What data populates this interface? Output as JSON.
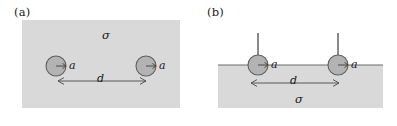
{
  "figure": {
    "width": 397,
    "height": 126,
    "background": "#ffffff",
    "ink_color": "#1a1a1a",
    "medium_fill": "#d9d9d9",
    "sphere_fill": "#b3b3b3",
    "sphere_stroke": "#6e6e6e",
    "line_color": "#555555"
  },
  "panels": [
    {
      "id": "a",
      "label": "(a)",
      "description": "Two spheres of radius a embedded fully inside a conducting medium of conductivity sigma, separated by center-to-center distance d",
      "medium": {
        "shape": "rectangle",
        "x": 22,
        "y": 20,
        "width": 158,
        "height": 88,
        "fill": "#d9d9d9"
      },
      "sigma": {
        "symbol": "σ",
        "x": 102,
        "y": 30
      },
      "spheres": [
        {
          "name": "left-sphere",
          "cx": 56,
          "cy": 66,
          "r": 10,
          "radius_label": "a",
          "radius_label_x": 69,
          "radius_label_y": 61,
          "radius_arrow": {
            "x1": 56,
            "y1": 66,
            "x2": 66,
            "y2": 66
          }
        },
        {
          "name": "right-sphere",
          "cx": 146,
          "cy": 66,
          "r": 10,
          "radius_label": "a",
          "radius_label_x": 159,
          "radius_label_y": 61,
          "radius_arrow": {
            "x1": 146,
            "y1": 66,
            "x2": 156,
            "y2": 66
          }
        }
      ],
      "distance": {
        "label": "d",
        "label_x": 97,
        "label_y": 75,
        "arrow": {
          "x1": 58,
          "y1": 81,
          "x2": 146,
          "y2": 81
        }
      }
    },
    {
      "id": "b",
      "label": "(b)",
      "description": "Two spheres of radius a half-buried at the flat surface of a conducting half-space of conductivity sigma, with vertical lead wires, separated by distance d",
      "medium": {
        "shape": "rectangle",
        "x": 20,
        "y": 65,
        "width": 165,
        "height": 43,
        "fill": "#d9d9d9"
      },
      "surface_line": {
        "x1": 20,
        "y1": 65,
        "x2": 185,
        "y2": 65
      },
      "sigma": {
        "symbol": "σ",
        "x": 97,
        "y": 94
      },
      "spheres": [
        {
          "name": "left-sphere",
          "cx": 60,
          "cy": 65,
          "r": 10,
          "radius_label": "a",
          "radius_label_x": 73,
          "radius_label_y": 60,
          "radius_arrow": {
            "x1": 60,
            "y1": 65,
            "x2": 70,
            "y2": 65
          },
          "lead_wire": {
            "x1": 60,
            "y1": 65,
            "x2": 60,
            "y2": 33
          }
        },
        {
          "name": "right-sphere",
          "cx": 140,
          "cy": 65,
          "r": 10,
          "radius_label": "a",
          "radius_label_x": 153,
          "radius_label_y": 60,
          "radius_arrow": {
            "x1": 140,
            "y1": 65,
            "x2": 150,
            "y2": 65
          },
          "lead_wire": {
            "x1": 140,
            "y1": 65,
            "x2": 140,
            "y2": 33
          }
        }
      ],
      "distance": {
        "label": "d",
        "label_x": 92,
        "label_y": 77,
        "arrow": {
          "x1": 53,
          "y1": 83,
          "x2": 141,
          "y2": 83
        }
      }
    }
  ]
}
